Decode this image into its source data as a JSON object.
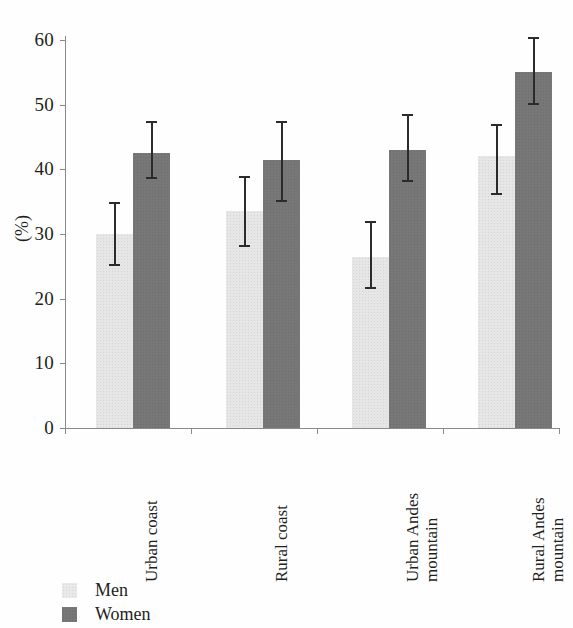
{
  "chart_data": {
    "type": "bar",
    "title": "",
    "xlabel": "",
    "ylabel": "(%)",
    "ylim": [
      0,
      60
    ],
    "ytick_step": 10,
    "yticks": [
      60,
      50,
      40,
      30,
      20,
      10,
      0
    ],
    "grid": false,
    "legend_position": "bottom-left",
    "categories": [
      "Urban coast",
      "Rural coast",
      "Urban Andes mountain",
      "Rural Andes mountain"
    ],
    "category_lines": [
      [
        "Urban coast"
      ],
      [
        "Rural coast"
      ],
      [
        "Urban Andes",
        "mountain"
      ],
      [
        "Rural Andes",
        "mountain"
      ]
    ],
    "series": [
      {
        "name": "Men",
        "color": "#e6e6e6",
        "values": [
          30.0,
          33.5,
          26.5,
          42.0
        ],
        "error_low": [
          25.0,
          28.0,
          21.5,
          36.0
        ],
        "error_high": [
          35.0,
          39.0,
          32.0,
          47.0
        ]
      },
      {
        "name": "Women",
        "color": "#777777",
        "values": [
          42.5,
          41.5,
          43.0,
          55.0
        ],
        "error_low": [
          38.5,
          35.0,
          38.0,
          50.0
        ],
        "error_high": [
          47.5,
          47.5,
          48.5,
          60.5
        ]
      }
    ]
  },
  "legend": {
    "items": [
      {
        "label": "Men",
        "swatch": "men"
      },
      {
        "label": "Women",
        "swatch": "women"
      }
    ]
  }
}
